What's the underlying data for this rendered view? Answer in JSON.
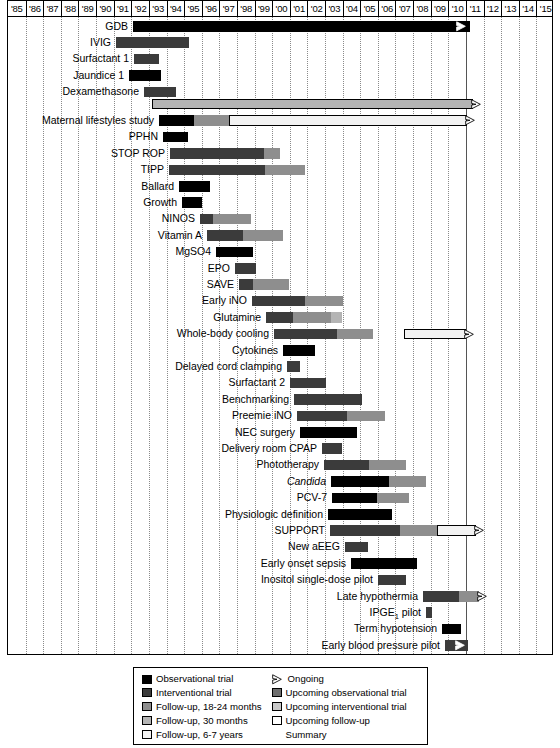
{
  "axis": {
    "years": [
      "'85",
      "'86",
      "'87",
      "'88",
      "'89",
      "'90",
      "'91",
      "'92",
      "'93",
      "'94",
      "'95",
      "'96",
      "'97",
      "'98",
      "'99",
      "'00",
      "'01",
      "'02",
      "'03",
      "'04",
      "'05",
      "'06",
      "'07",
      "'08",
      "'09",
      "'10",
      "'11",
      "'12",
      "'13",
      "'14",
      "'15"
    ]
  },
  "colors": {
    "observational": "#000000",
    "interventional": "#3b3b3b",
    "followup_18_24": "#8e8e8e",
    "followup_30": "#b4b4b4",
    "followup_6_7": "#f2f2f2",
    "upcoming_observational": "#6e6e6e",
    "upcoming_interventional": "#c9c9c9",
    "upcoming_followup": "#ffffff",
    "gridline": "#8a8a8a",
    "nowline": "#555555"
  },
  "legend": {
    "left": [
      {
        "swatch": "observational",
        "label": "Observational trial"
      },
      {
        "swatch": "interventional",
        "label": "Interventional trial"
      },
      {
        "swatch": "followup_18_24",
        "label": "Follow-up, 18-24 months"
      },
      {
        "swatch": "followup_30",
        "label": "Follow-up, 30 months"
      },
      {
        "swatch": "followup_6_7",
        "label": "Follow-up, 6-7 years"
      }
    ],
    "right": [
      {
        "swatch": "arrow-icon",
        "label": "Ongoing"
      },
      {
        "swatch": "upcoming_observational",
        "label": "Upcoming observational trial"
      },
      {
        "swatch": "upcoming_interventional",
        "label": "Upcoming interventional trial"
      },
      {
        "swatch": "upcoming_followup",
        "label": "Upcoming follow-up"
      }
    ],
    "right_continuation": "Summary"
  },
  "chart_data": {
    "type": "bar",
    "subtype": "gantt",
    "title": "",
    "xlabel": "",
    "ylabel": "",
    "xlim": [
      "1985",
      "2016"
    ],
    "grid": true,
    "now_marker_year": "2011",
    "categories": [
      "GDB",
      "IVIG",
      "Surfactant 1",
      "Jaundice 1",
      "Dexamethasone",
      "Maternal lifestyles study (ongoing)",
      "Maternal lifestyles study",
      "PPHN",
      "STOP ROP",
      "TIPP",
      "Ballard",
      "Growth",
      "NINOS",
      "Vitamin A",
      "MgSO4",
      "EPO",
      "SAVE",
      "Early iNO",
      "Glutamine",
      "Whole-body cooling",
      "Cytokines",
      "Delayed cord clamping",
      "Surfactant 2",
      "Benchmarking",
      "Preemie iNO",
      "NEC surgery",
      "Delivery room CPAP",
      "Phototherapy",
      "Candida",
      "PCV-7",
      "Physiologic definition",
      "SUPPORT",
      "New aEEG",
      "Early onset sepsis",
      "Inositol single-dose pilot",
      "Late hypothermia",
      "IPGE1 pilot",
      "Term hypotension",
      "Early blood pressure pilot",
      "Preemie aEEG pilot",
      "Inositol multi-dose pilot",
      "NEC laparotomy vs. drain"
    ],
    "rows": [
      {
        "label": "GDB",
        "labelHtml": "GDB",
        "y": 18.6,
        "arrow": true,
        "segments": [
          {
            "type": "observational",
            "x": 125,
            "w": 337
          }
        ]
      },
      {
        "label": "IVIG",
        "labelHtml": "IVIG",
        "y": 35.0,
        "segments": [
          {
            "type": "interventional",
            "x": 108,
            "w": 73
          }
        ]
      },
      {
        "label": "Surfactant 1",
        "labelHtml": "Surfactant 1",
        "y": 51.4,
        "segments": [
          {
            "type": "interventional",
            "x": 126,
            "w": 25
          }
        ]
      },
      {
        "label": "Jaundice 1",
        "labelHtml": "Jaundice 1",
        "y": 67.8,
        "segments": [
          {
            "type": "observational",
            "x": 121,
            "w": 32
          }
        ]
      },
      {
        "label": "Dexamethasone",
        "labelHtml": "Dexamethasone",
        "y": 84.2,
        "segments": [
          {
            "type": "interventional",
            "x": 136,
            "w": 32
          }
        ]
      },
      {
        "label": "",
        "labelHtml": "",
        "y": 96.5,
        "arrowOutline": true,
        "segments": [
          {
            "type": "upcoming_interventional_gray",
            "x": 144,
            "w": 321
          }
        ]
      },
      {
        "label": "Maternal lifestyles study",
        "labelHtml": "Maternal lifestyles study",
        "y": 113.0,
        "arrowOutline": true,
        "segments": [
          {
            "type": "observational",
            "x": 151,
            "w": 35
          },
          {
            "type": "followup_18_24",
            "x": 186,
            "w": 35
          },
          {
            "type": "followup_6_7",
            "x": 221,
            "w": 238
          }
        ]
      },
      {
        "label": "PPHN",
        "labelHtml": "PPHN",
        "y": 129.4,
        "segments": [
          {
            "type": "observational",
            "x": 155,
            "w": 25
          }
        ]
      },
      {
        "label": "STOP ROP",
        "labelHtml": "STOP ROP",
        "y": 145.8,
        "segments": [
          {
            "type": "interventional",
            "x": 162,
            "w": 94
          },
          {
            "type": "followup_18_24",
            "x": 256,
            "w": 16
          }
        ]
      },
      {
        "label": "TIPP",
        "labelHtml": "TIPP",
        "y": 162.2,
        "segments": [
          {
            "type": "interventional",
            "x": 161,
            "w": 96
          },
          {
            "type": "followup_18_24",
            "x": 257,
            "w": 40
          }
        ]
      },
      {
        "label": "Ballard",
        "labelHtml": "Ballard",
        "y": 178.6,
        "segments": [
          {
            "type": "observational",
            "x": 171,
            "w": 31
          }
        ]
      },
      {
        "label": "Growth",
        "labelHtml": "Growth",
        "y": 195.0,
        "segments": [
          {
            "type": "observational",
            "x": 174,
            "w": 20
          }
        ]
      },
      {
        "label": "NINOS",
        "labelHtml": "NINOS",
        "y": 211.4,
        "segments": [
          {
            "type": "interventional",
            "x": 192,
            "w": 13
          },
          {
            "type": "followup_18_24",
            "x": 205,
            "w": 38
          }
        ]
      },
      {
        "label": "Vitamin A",
        "labelHtml": "Vitamin A",
        "y": 227.8,
        "segments": [
          {
            "type": "interventional",
            "x": 199,
            "w": 36
          },
          {
            "type": "followup_18_24",
            "x": 235,
            "w": 40
          }
        ]
      },
      {
        "label": "MgSO4",
        "labelHtml": "MgSO4",
        "y": 244.2,
        "segments": [
          {
            "type": "observational",
            "x": 208,
            "w": 37
          }
        ]
      },
      {
        "label": "EPO",
        "labelHtml": "EPO",
        "y": 260.6,
        "segments": [
          {
            "type": "interventional",
            "x": 227,
            "w": 21
          }
        ]
      },
      {
        "label": "SAVE",
        "labelHtml": "SAVE",
        "y": 277.0,
        "segments": [
          {
            "type": "interventional",
            "x": 231,
            "w": 14
          },
          {
            "type": "followup_18_24",
            "x": 245,
            "w": 36
          }
        ]
      },
      {
        "label": "Early iNO",
        "labelHtml": "Early iNO",
        "y": 293.4,
        "segments": [
          {
            "type": "interventional",
            "x": 244,
            "w": 53
          },
          {
            "type": "followup_18_24",
            "x": 297,
            "w": 38
          }
        ]
      },
      {
        "label": "Glutamine",
        "labelHtml": "Glutamine",
        "y": 309.8,
        "segments": [
          {
            "type": "interventional",
            "x": 258,
            "w": 27
          },
          {
            "type": "followup_18_24",
            "x": 285,
            "w": 38
          },
          {
            "type": "followup_30",
            "x": 323,
            "w": 11
          }
        ]
      },
      {
        "label": "Whole-body cooling",
        "labelHtml": "Whole-body cooling",
        "y": 326.2,
        "arrowFar": true,
        "segments": [
          {
            "type": "interventional",
            "x": 266,
            "w": 63
          },
          {
            "type": "followup_18_24",
            "x": 329,
            "w": 36
          },
          {
            "type": "followup_6_7",
            "x": 396,
            "w": 62
          }
        ]
      },
      {
        "label": "Cytokines",
        "labelHtml": "Cytokines",
        "y": 342.6,
        "segments": [
          {
            "type": "observational",
            "x": 275,
            "w": 32
          }
        ]
      },
      {
        "label": "Delayed cord clamping",
        "labelHtml": "Delayed cord clamping",
        "y": 359.0,
        "segments": [
          {
            "type": "interventional",
            "x": 279,
            "w": 13
          }
        ]
      },
      {
        "label": "Surfactant 2",
        "labelHtml": "Surfactant 2",
        "y": 375.4,
        "segments": [
          {
            "type": "interventional",
            "x": 282,
            "w": 36
          }
        ]
      },
      {
        "label": "Benchmarking",
        "labelHtml": "Benchmarking",
        "y": 391.8,
        "segments": [
          {
            "type": "interventional",
            "x": 286,
            "w": 68
          }
        ]
      },
      {
        "label": "Preemie iNO",
        "labelHtml": "Preemie iNO",
        "y": 408.2,
        "segments": [
          {
            "type": "interventional",
            "x": 289,
            "w": 50
          },
          {
            "type": "followup_18_24",
            "x": 339,
            "w": 38
          }
        ]
      },
      {
        "label": "NEC surgery",
        "labelHtml": "NEC surgery",
        "y": 424.6,
        "segments": [
          {
            "type": "observational",
            "x": 292,
            "w": 57
          }
        ]
      },
      {
        "label": "Delivery room CPAP",
        "labelHtml": "Delivery room CPAP",
        "y": 441.0,
        "segments": [
          {
            "type": "interventional",
            "x": 314,
            "w": 20
          }
        ]
      },
      {
        "label": "Phototherapy",
        "labelHtml": "Phototherapy",
        "y": 457.4,
        "segments": [
          {
            "type": "interventional",
            "x": 316,
            "w": 45
          },
          {
            "type": "followup_18_24",
            "x": 361,
            "w": 37
          }
        ]
      },
      {
        "label": "Candida",
        "labelHtml": "Candida",
        "italic": true,
        "y": 473.8,
        "segments": [
          {
            "type": "observational",
            "x": 323,
            "w": 58
          },
          {
            "type": "followup_18_24",
            "x": 381,
            "w": 37
          }
        ]
      },
      {
        "label": "PCV-7",
        "labelHtml": "PCV-7",
        "y": 490.2,
        "segments": [
          {
            "type": "observational",
            "x": 324,
            "w": 45
          },
          {
            "type": "followup_18_24",
            "x": 369,
            "w": 32
          }
        ]
      },
      {
        "label": "Physiologic definition",
        "labelHtml": "Physiologic definition",
        "y": 506.6,
        "segments": [
          {
            "type": "observational",
            "x": 320,
            "w": 64
          }
        ]
      },
      {
        "label": "SUPPORT",
        "labelHtml": "SUPPORT",
        "y": 523.0,
        "arrowOutline": true,
        "segments": [
          {
            "type": "interventional",
            "x": 322,
            "w": 70
          },
          {
            "type": "followup_18_24",
            "x": 392,
            "w": 37
          },
          {
            "type": "followup_6_7",
            "x": 429,
            "w": 39
          }
        ]
      },
      {
        "label": "New aEEG",
        "labelHtml": "New aEEG",
        "y": 539.4,
        "segments": [
          {
            "type": "interventional",
            "x": 337,
            "w": 23
          }
        ]
      },
      {
        "label": "Early onset sepsis",
        "labelHtml": "Early onset sepsis",
        "y": 555.8,
        "segments": [
          {
            "type": "observational",
            "x": 343,
            "w": 66
          }
        ]
      },
      {
        "label": "Inositol single-dose pilot",
        "labelHtml": "Inositol single-dose pilot",
        "y": 572.2,
        "segments": [
          {
            "type": "interventional",
            "x": 370,
            "w": 28
          }
        ]
      },
      {
        "label": "Late hypothermia",
        "labelHtml": "Late hypothermia",
        "y": 588.6,
        "arrowOutline": true,
        "segments": [
          {
            "type": "interventional",
            "x": 415,
            "w": 36
          },
          {
            "type": "followup_18_24",
            "x": 451,
            "w": 20
          }
        ]
      },
      {
        "label": "IPGE1 pilot",
        "labelHtml": "IPGE<sub>1</sub> pilot",
        "y": 605.0,
        "segments": [
          {
            "type": "interventional",
            "x": 418,
            "w": 6
          }
        ]
      },
      {
        "label": "Term hypotension",
        "labelHtml": "Term hypotension",
        "y": 621.4,
        "segments": [
          {
            "type": "observational",
            "x": 434,
            "w": 19
          }
        ]
      },
      {
        "label": "Early blood pressure pilot",
        "labelHtml": "Early blood pressure pilot",
        "y": 637.8,
        "arrowInset": true,
        "segments": [
          {
            "type": "interventional",
            "x": 437,
            "w": 23
          }
        ]
      },
      {
        "label": "Preemie aEEG pilot",
        "labelHtml": "Preemie aEEG pilot",
        "y": 654.2,
        "arrowInset": true,
        "segments": [
          {
            "type": "observational",
            "x": 437,
            "w": 23
          }
        ]
      },
      {
        "label": "Inositol multi-dose pilot",
        "labelHtml": "Inositol multi-dose pilot",
        "y": 670.6,
        "segments": [
          {
            "type": "upcoming_interventional",
            "x": 448,
            "w": 22
          },
          {
            "type": "upcoming_followup",
            "x": 470,
            "w": 24
          }
        ]
      },
      {
        "label": "NEC laparotomy vs. drain",
        "labelHtml": "NEC laparotomy vs. drain",
        "y": 687.0,
        "segments": [
          {
            "type": "upcoming_interventional",
            "x": 448,
            "w": 22
          },
          {
            "type": "upcoming_followup",
            "x": 470,
            "w": 24
          }
        ]
      }
    ]
  }
}
